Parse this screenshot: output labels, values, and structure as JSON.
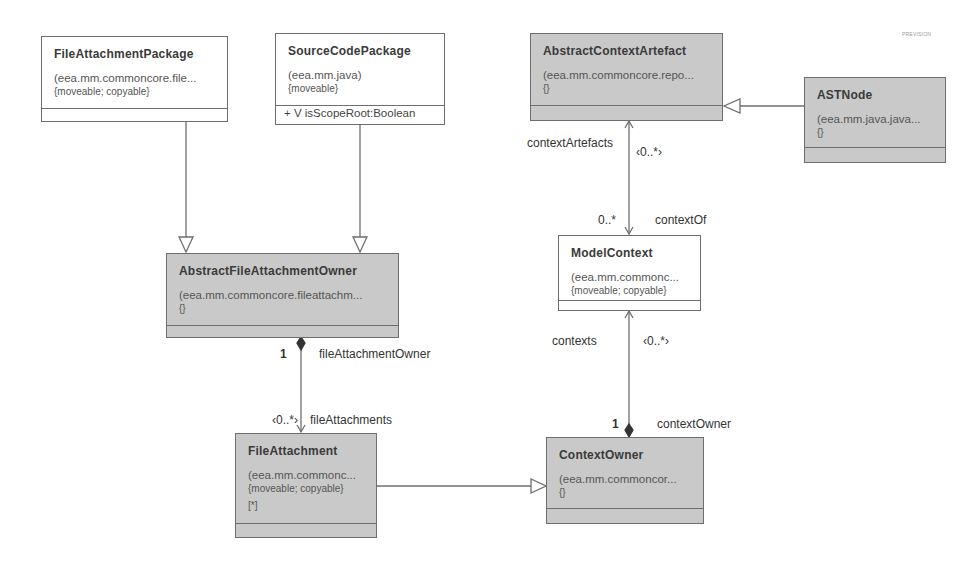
{
  "watermark": "PREVISION",
  "classes": {
    "file_attachment_package": {
      "name": "FileAttachmentPackage",
      "namespace": "(eea.mm.commoncore.file...",
      "properties": "{moveable; copyable}",
      "attributes": []
    },
    "source_code_package": {
      "name": "SourceCodePackage",
      "namespace": "(eea.mm.java)",
      "properties": "{moveable}",
      "attributes": [
        "+ V isScopeRoot:Boolean"
      ]
    },
    "abstract_context_artefact": {
      "name": "AbstractContextArtefact",
      "namespace": "(eea.mm.commoncore.repo...",
      "properties": "{}",
      "attributes": []
    },
    "ast_node": {
      "name": "ASTNode",
      "namespace": "(eea.mm.java.java...",
      "properties": "{}",
      "attributes": []
    },
    "abstract_file_attachment_owner": {
      "name": "AbstractFileAttachmentOwner",
      "namespace": "(eea.mm.commoncore.fileattachm...",
      "properties": "{}",
      "attributes": []
    },
    "model_context": {
      "name": "ModelContext",
      "namespace": "(eea.mm.commonc...",
      "properties": "{moveable; copyable}",
      "attributes": []
    },
    "file_attachment": {
      "name": "FileAttachment",
      "namespace": "(eea.mm.commonc...",
      "properties": "{moveable; copyable}",
      "multiplicity": "[*]",
      "attributes": []
    },
    "context_owner": {
      "name": "ContextOwner",
      "namespace": "(eea.mm.commoncor...",
      "properties": "{}",
      "attributes": []
    }
  },
  "associations": {
    "file_attachment_owner": {
      "role": "fileAttachmentOwner",
      "multiplicity": "1"
    },
    "file_attachments": {
      "role": "fileAttachments",
      "multiplicity": "‹0..*›"
    },
    "context_artefacts": {
      "role": "contextArtefacts",
      "multiplicity": "‹0..*›"
    },
    "context_of": {
      "role": "contextOf",
      "multiplicity": "0..*"
    },
    "contexts": {
      "role": "contexts",
      "multiplicity": "‹0..*›"
    },
    "context_owner": {
      "role": "contextOwner",
      "multiplicity": "1"
    }
  },
  "colors": {
    "abstract_fill": "#c9c9c9",
    "concrete_fill": "#ffffff",
    "line": "#6e6e6e"
  }
}
